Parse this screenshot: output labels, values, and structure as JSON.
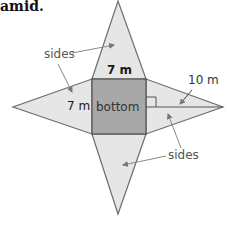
{
  "title": "amid.",
  "labels": {
    "sides_top": "sides",
    "sides_bottom": "sides",
    "top_edge": "7 m",
    "left_edge": "7 m",
    "center": "bottom",
    "slant": "10 m"
  },
  "colors": {
    "side_fill": "#e6e6e6",
    "bottom_fill": "#a8a8a8",
    "stroke": "#6e6e6e"
  }
}
